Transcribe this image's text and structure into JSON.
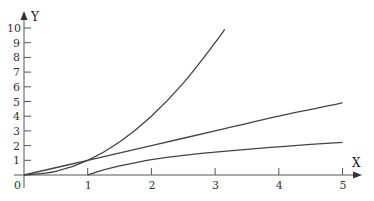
{
  "chart_data": {
    "type": "line",
    "title": "",
    "xlabel": "X",
    "ylabel": "Y",
    "xlim": [
      0,
      5.3
    ],
    "ylim": [
      0,
      10.5
    ],
    "grid": false,
    "legend": null,
    "x_ticks": [
      "1",
      "2",
      "3",
      "4",
      "5"
    ],
    "y_ticks": [
      "1",
      "2",
      "3",
      "4",
      "5",
      "6",
      "7",
      "8",
      "9",
      "10"
    ],
    "origin_label": "0",
    "series": [
      {
        "name": "y = x^2 (steep curve)",
        "x": [
          0,
          0.5,
          1,
          1.5,
          2,
          2.5,
          3,
          3.15
        ],
        "values": [
          0,
          0.25,
          1,
          2.25,
          4,
          6.25,
          9,
          9.9
        ]
      },
      {
        "name": "y = x (straight line)",
        "x": [
          0,
          1,
          2,
          3,
          4,
          5
        ],
        "values": [
          0,
          1,
          2,
          3,
          4,
          4.9
        ]
      },
      {
        "name": "log-like curve from (1,0)",
        "x": [
          1,
          1.25,
          1.5,
          2,
          2.5,
          3,
          3.5,
          4,
          4.5,
          5
        ],
        "values": [
          0,
          0.35,
          0.62,
          1.05,
          1.33,
          1.55,
          1.75,
          1.92,
          2.08,
          2.22
        ]
      }
    ]
  },
  "colors": {
    "axis": "#555555",
    "curve": "#444444",
    "background": "#ffffff"
  }
}
